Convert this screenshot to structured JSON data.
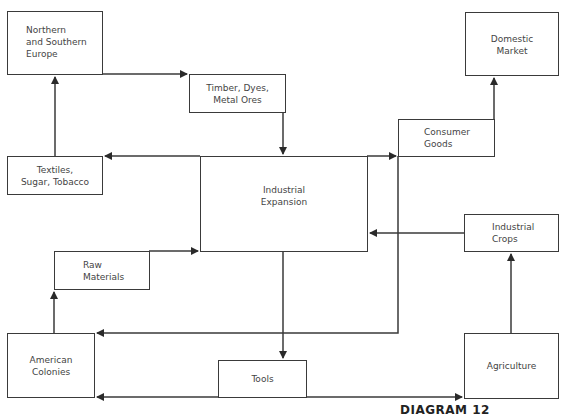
{
  "diagram": {
    "nodes": {
      "northern_southern_europe": "Northern\nand Southern\nEurope",
      "timber_dyes_metal_ores": "Timber, Dyes,\nMetal Ores",
      "domestic_market": "Domestic\nMarket",
      "consumer_goods": "Consumer\nGoods",
      "textiles_sugar_tobacco": "Textiles,\nSugar, Tobacco",
      "industrial_expansion": "Industrial\nExpansion",
      "industrial_crops": "Industrial\nCrops",
      "raw_materials": "Raw\nMaterials",
      "american_colonies": "American\nColonies",
      "tools": "Tools",
      "agriculture": "Agriculture"
    },
    "edges": [
      {
        "from": "Textiles, Sugar, Tobacco",
        "to": "Northern and Southern Europe"
      },
      {
        "from": "Northern and Southern Europe",
        "to": "Timber, Dyes, Metal Ores"
      },
      {
        "from": "Timber, Dyes, Metal Ores",
        "to": "Industrial Expansion"
      },
      {
        "from": "Industrial Expansion",
        "to": "Textiles, Sugar, Tobacco"
      },
      {
        "from": "Industrial Expansion",
        "to": "Consumer Goods"
      },
      {
        "from": "Consumer Goods",
        "to": "Domestic Market"
      },
      {
        "from": "Consumer Goods",
        "to": "American Colonies"
      },
      {
        "from": "Industrial Crops",
        "to": "Industrial Expansion"
      },
      {
        "from": "Agriculture",
        "to": "Industrial Crops"
      },
      {
        "from": "American Colonies",
        "to": "Raw Materials"
      },
      {
        "from": "Raw Materials",
        "to": "Industrial Expansion"
      },
      {
        "from": "Industrial Expansion",
        "to": "Tools"
      },
      {
        "from": "Tools",
        "to": "American Colonies"
      },
      {
        "from": "Tools",
        "to": "Agriculture"
      }
    ],
    "caption": "DIAGRAM 12",
    "line_color": "#3a3a3a"
  }
}
